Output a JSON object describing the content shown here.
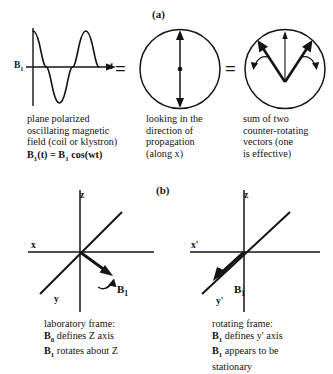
{
  "figure": {
    "panel_a_label": "(a)",
    "panel_b_label": "(b)",
    "equals_1": "=",
    "equals_2": "="
  },
  "panel_a": {
    "wave_diagram": {
      "y_axis_label": "B",
      "y_axis_label_sub": "1",
      "x_axis_label": "t",
      "cycles": 3
    },
    "caption_1": {
      "line1": "plane polarized",
      "line2": "oscillating magnetic",
      "line3": "field (coil or klystron)",
      "line4_pre": "B",
      "line4_sub1": "1",
      "line4_mid": "(t) = B",
      "line4_sub2": "1",
      "line4_post": " cos(wt)"
    },
    "caption_2": {
      "line1": "looking in the",
      "line2": "direction of",
      "line3": "propagation",
      "line4": "(along x)"
    },
    "caption_3": {
      "line1": "sum of two",
      "line2": "counter-rotating",
      "line3": "vectors (one",
      "line4": "is effective)"
    }
  },
  "panel_b": {
    "lab_frame_axes": {
      "x_label": "x",
      "y_label": "y",
      "z_label": "z",
      "vector_label": "B",
      "vector_label_sub": "1"
    },
    "rotating_frame_axes": {
      "x_label": "x'",
      "y_label": "y'",
      "z_label": "z",
      "vector_label": "B",
      "vector_label_sub": "1"
    },
    "caption_left": {
      "line1": "laboratory frame:",
      "line2_pre": "B",
      "line2_sub": "0",
      "line2_post": " defines Z axis",
      "line3_pre": "B",
      "line3_sub": "1",
      "line3_post": " rotates about Z"
    },
    "caption_right": {
      "line1": "rotating frame:",
      "line2_pre": "B",
      "line2_sub": "1",
      "line2_post": " defines y' axis",
      "line3_pre": "B",
      "line3_sub": "1",
      "line3_post": " appears to be",
      "line4": "stationary"
    }
  },
  "colors": {
    "ink": "#141414",
    "background": "#ffffff"
  }
}
